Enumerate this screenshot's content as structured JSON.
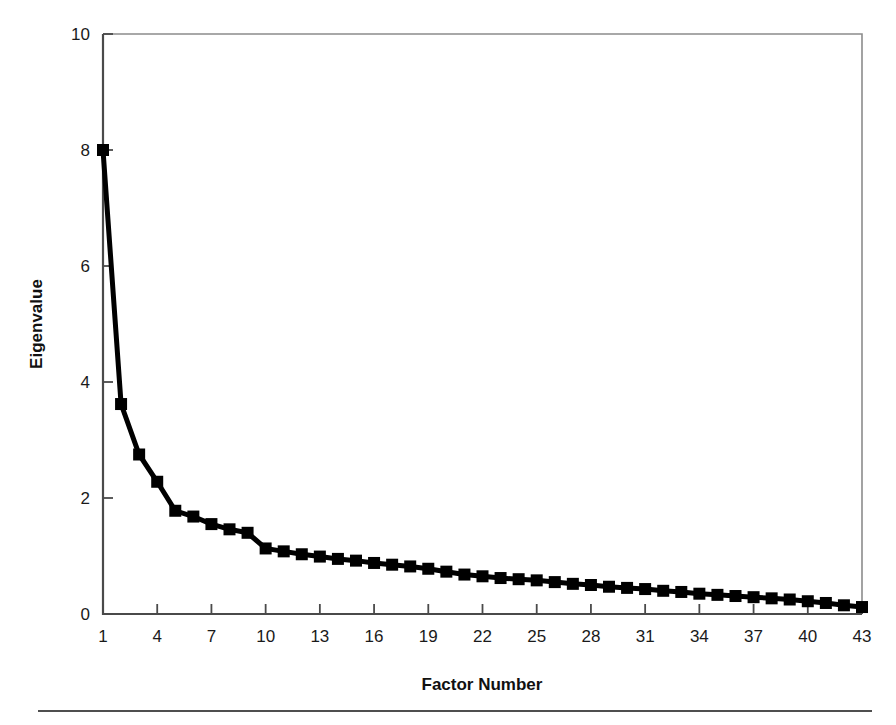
{
  "chart_data": {
    "type": "line",
    "title": "",
    "subtitle": "",
    "xlabel": "Factor Number",
    "ylabel": "Eigenvalue",
    "xlim": [
      1,
      43
    ],
    "ylim": [
      0,
      10
    ],
    "grid": false,
    "legend": null,
    "marker": "square",
    "line_color": "#000000",
    "marker_color": "#000000",
    "xticks": [
      1,
      4,
      7,
      10,
      13,
      16,
      19,
      22,
      25,
      28,
      31,
      34,
      37,
      40,
      43
    ],
    "xtick_labels": [
      "1",
      "4",
      "7",
      "10",
      "13",
      "16",
      "19",
      "22",
      "25",
      "28",
      "31",
      "34",
      "37",
      "40",
      "43"
    ],
    "yticks": [
      0,
      2,
      4,
      6,
      8,
      10
    ],
    "ytick_labels": [
      "0",
      "2",
      "4",
      "6",
      "8",
      "10"
    ],
    "x": [
      1,
      2,
      3,
      4,
      5,
      6,
      7,
      8,
      9,
      10,
      11,
      12,
      13,
      14,
      15,
      16,
      17,
      18,
      19,
      20,
      21,
      22,
      23,
      24,
      25,
      26,
      27,
      28,
      29,
      30,
      31,
      32,
      33,
      34,
      35,
      36,
      37,
      38,
      39,
      40,
      41,
      42,
      43
    ],
    "values": [
      8.0,
      3.62,
      2.75,
      2.28,
      1.78,
      1.68,
      1.55,
      1.46,
      1.4,
      1.13,
      1.08,
      1.03,
      0.99,
      0.95,
      0.92,
      0.88,
      0.85,
      0.82,
      0.78,
      0.73,
      0.68,
      0.65,
      0.62,
      0.6,
      0.58,
      0.55,
      0.52,
      0.5,
      0.47,
      0.45,
      0.43,
      0.4,
      0.38,
      0.35,
      0.33,
      0.31,
      0.29,
      0.27,
      0.25,
      0.22,
      0.19,
      0.15,
      0.12
    ],
    "series": [
      {
        "name": "Eigenvalue",
        "values": [
          8.0,
          3.62,
          2.75,
          2.28,
          1.78,
          1.68,
          1.55,
          1.46,
          1.4,
          1.13,
          1.08,
          1.03,
          0.99,
          0.95,
          0.92,
          0.88,
          0.85,
          0.82,
          0.78,
          0.73,
          0.68,
          0.65,
          0.62,
          0.6,
          0.58,
          0.55,
          0.52,
          0.5,
          0.47,
          0.45,
          0.43,
          0.4,
          0.38,
          0.35,
          0.33,
          0.31,
          0.29,
          0.27,
          0.25,
          0.22,
          0.19,
          0.15,
          0.12
        ]
      }
    ]
  },
  "figure": {
    "background_color": "#ffffff",
    "frame_color": "#8c8c8c",
    "axis_color": "#4a4a4a"
  }
}
